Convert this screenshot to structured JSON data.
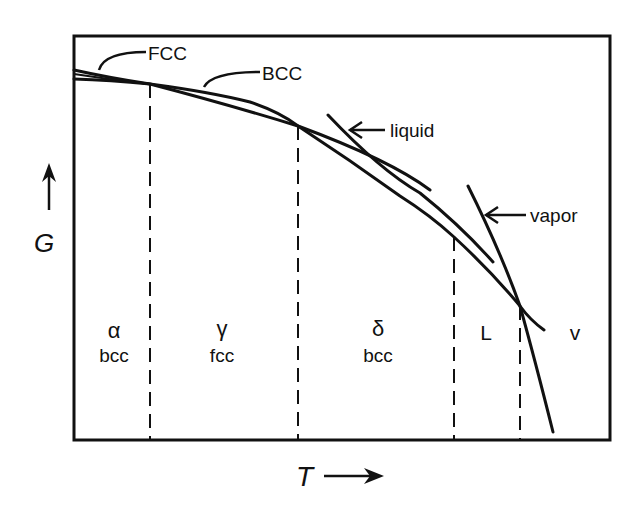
{
  "diagram": {
    "title": "",
    "axes": {
      "y_label": "G",
      "x_label": "T",
      "y_arrow": "up-arrow",
      "x_arrow": "right-arrow"
    },
    "curve_labels": {
      "fcc": "FCC",
      "bcc": "BCC",
      "liquid": "liquid",
      "vapor": "vapor"
    },
    "regions": [
      {
        "symbol": "α",
        "structure": "bcc"
      },
      {
        "symbol": "γ",
        "structure": "fcc"
      },
      {
        "symbol": "δ",
        "structure": "bcc"
      },
      {
        "symbol": "L",
        "structure": ""
      },
      {
        "symbol": "v",
        "structure": ""
      }
    ],
    "colors": {
      "line": "#111111",
      "background": "#ffffff"
    }
  }
}
